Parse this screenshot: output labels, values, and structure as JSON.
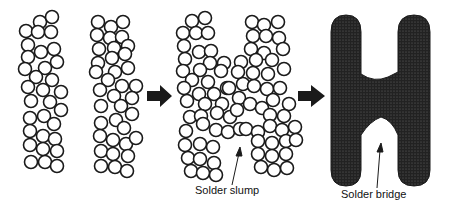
{
  "diagram": {
    "stages": [
      {
        "name": "solder-paste-deposits",
        "description": "Two separate columns of solder particles"
      },
      {
        "name": "solder-slump",
        "description": "Particles spread between pads"
      },
      {
        "name": "solder-bridge",
        "description": "Molten solder joins pads"
      }
    ],
    "labels": {
      "slump": "Solder slump",
      "bridge": "Solder bridge"
    },
    "colors": {
      "stroke": "#1a1a1a",
      "fill_bridge": "#2b2b2b",
      "background": "#ffffff"
    }
  }
}
